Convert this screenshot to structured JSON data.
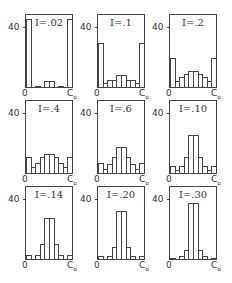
{
  "chart_data": {
    "type": "bar",
    "title": "",
    "xlabel": "",
    "ylabel": "",
    "layout": "3x3 grid of histograms",
    "x_tick_labels": [
      "0",
      "C0"
    ],
    "y_tick_labels": [
      "40"
    ],
    "ylim": [
      0,
      49
    ],
    "grid": false,
    "panels": [
      {
        "label": "I=.02",
        "values": [
          46,
          0,
          1,
          0,
          4,
          4,
          0,
          1,
          0,
          46
        ]
      },
      {
        "label": "I=.1",
        "values": [
          30,
          3,
          5,
          5,
          8,
          8,
          5,
          5,
          3,
          30
        ]
      },
      {
        "label": "I=.2",
        "values": [
          20,
          4,
          7,
          9,
          11,
          11,
          9,
          7,
          4,
          20
        ]
      },
      {
        "label": "I=.4",
        "values": [
          11,
          4,
          7,
          11,
          13,
          13,
          11,
          7,
          4,
          11
        ]
      },
      {
        "label": "I=.6",
        "values": [
          7,
          3,
          6,
          11,
          18,
          18,
          11,
          6,
          3,
          7
        ]
      },
      {
        "label": "I=.10",
        "values": [
          5,
          2,
          5,
          11,
          26,
          26,
          11,
          5,
          2,
          5
        ]
      },
      {
        "label": "I=.14",
        "values": [
          3,
          0,
          3,
          10,
          28,
          28,
          10,
          3,
          0,
          3
        ]
      },
      {
        "label": "I=.20",
        "values": [
          2,
          0,
          2,
          8,
          33,
          33,
          8,
          2,
          0,
          2
        ]
      },
      {
        "label": "I=.30",
        "values": [
          1,
          0,
          2,
          6,
          38,
          38,
          6,
          2,
          0,
          1
        ]
      }
    ]
  },
  "labels": {
    "y_tick": "40",
    "x_left": "0",
    "x_right": "C",
    "x_right_sub": "o",
    "panel_titles": [
      "I=.02",
      "I=.1",
      "I=.2",
      "I=.4",
      "I=.6",
      "I=.10",
      "I=.14",
      "I=.20",
      "I=.30"
    ]
  }
}
